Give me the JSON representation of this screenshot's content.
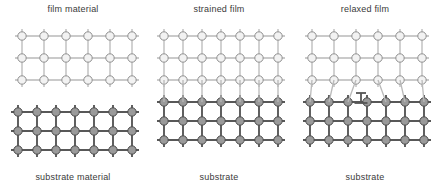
{
  "figure": {
    "width": 438,
    "height": 190,
    "background": "#ffffff"
  },
  "style": {
    "film_node_fill": "#f2f2f2",
    "film_node_stroke": "#8f8f8f",
    "film_bond_color": "#b9b9b9",
    "substrate_node_fill": "#9a9a9a",
    "substrate_node_stroke": "#4a4a4a",
    "substrate_bond_color": "#585858",
    "dislocation_color": "#555555",
    "text_color": "#3a3a3a"
  },
  "panels": [
    {
      "id": "film-material",
      "title": "film material",
      "caption": "substrate material",
      "film": {
        "columns": 6,
        "rows": 3,
        "spacing_x": 22,
        "spacing_y": 22,
        "origin_x": 22,
        "origin_y": 36,
        "node_radius": 4.2,
        "stub": 7,
        "bonded_to_substrate": false
      },
      "substrate": {
        "columns": 7,
        "rows": 3,
        "spacing_x": 19,
        "spacing_y": 19,
        "origin_x": 18,
        "origin_y": 112,
        "node_radius": 4.2,
        "stub": 7
      },
      "dislocation": null
    },
    {
      "id": "strained-film",
      "title": "strained film",
      "caption": "substrate",
      "film": {
        "columns": 7,
        "rows": 3,
        "spacing_x": 19,
        "spacing_y": 22,
        "origin_x": 18,
        "origin_y": 36,
        "node_radius": 4.2,
        "stub": 7,
        "bonded_to_substrate": true
      },
      "substrate": {
        "columns": 7,
        "rows": 3,
        "spacing_x": 19,
        "spacing_y": 19,
        "origin_x": 18,
        "origin_y": 102,
        "node_radius": 4.2,
        "stub": 7
      },
      "dislocation": null
    },
    {
      "id": "relaxed-film",
      "title": "relaxed film",
      "caption": "substrate",
      "film": {
        "columns": 6,
        "rows": 3,
        "spacing_x": 22,
        "spacing_y": 22,
        "origin_x": 20,
        "origin_y": 36,
        "node_radius": 4.2,
        "stub": 7,
        "bonded_to_substrate": true
      },
      "substrate": {
        "columns": 7,
        "rows": 3,
        "spacing_x": 19,
        "spacing_y": 19,
        "origin_x": 18,
        "origin_y": 102,
        "node_radius": 4.2,
        "stub": 7
      },
      "dislocation": {
        "symbol": "inverted-tee",
        "label": "misfit dislocation",
        "x": 69,
        "y": 93,
        "stem_height": 10,
        "bar_width": 13,
        "skip_substrate_column": 3
      }
    }
  ]
}
